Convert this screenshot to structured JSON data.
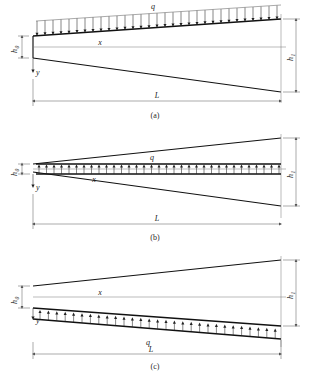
{
  "figure": {
    "symbols": {
      "load": "q",
      "length": "L",
      "height_left": "h",
      "height_left_sub": "0",
      "height_right": "h",
      "height_right_sub": "1",
      "axis_x": "x",
      "axis_y": "y"
    },
    "colors": {
      "outline": "#111111",
      "axis": "#777777",
      "dimension": "#555555",
      "arrow": "#222222",
      "background": "#ffffff"
    }
  },
  "panels": [
    {
      "id": "a",
      "caption": "(a)",
      "load_label": "q",
      "load_position": "top-edge",
      "load_direction": "downward",
      "length_label": "L",
      "left_height_label": "h",
      "left_height_sub": "0",
      "right_height_label": "h",
      "right_height_sub": "1",
      "x_label": "x",
      "y_label": "y",
      "arrow_count": 31
    },
    {
      "id": "b",
      "caption": "(b)",
      "load_label": "q",
      "load_position": "centerline",
      "load_direction": "upward",
      "length_label": "L",
      "left_height_label": "h",
      "left_height_sub": "0",
      "right_height_label": "h",
      "right_height_sub": "1",
      "x_label": "x",
      "y_label": "y",
      "arrow_count": 33
    },
    {
      "id": "c",
      "caption": "(c)",
      "load_label": "q",
      "load_position": "bottom-edge",
      "load_direction": "upward",
      "length_label": "L",
      "left_height_label": "h",
      "left_height_sub": "0",
      "right_height_label": "h",
      "right_height_sub": "1",
      "x_label": "x",
      "y_label": "y",
      "arrow_count": 30
    }
  ]
}
